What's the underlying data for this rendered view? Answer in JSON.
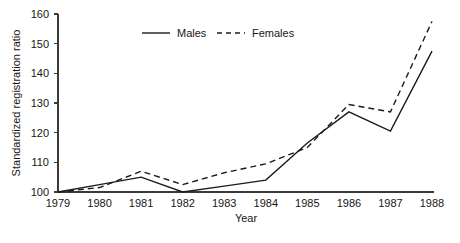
{
  "chart_data": {
    "type": "line",
    "title": "",
    "xlabel": "Year",
    "ylabel": "Standardized registration ratio",
    "x": [
      1979,
      1980,
      1981,
      1982,
      1983,
      1984,
      1985,
      1986,
      1987,
      1988
    ],
    "xtick_labels": [
      "1979",
      "1980",
      "1981",
      "1982",
      "1983",
      "1984",
      "1985",
      "1986",
      "1987",
      "1988"
    ],
    "ytick_labels": [
      "100",
      "110",
      "120",
      "130",
      "140",
      "150",
      "160"
    ],
    "yticks": [
      100,
      110,
      120,
      130,
      140,
      150,
      160
    ],
    "ylim": [
      97,
      161
    ],
    "xlim": [
      1979,
      1988
    ],
    "grid": false,
    "legend_position": "top-center",
    "series": [
      {
        "name": "Males",
        "style": "solid",
        "color": "#1c1c1c",
        "values": [
          100.0,
          102.5,
          105.0,
          100.0,
          102.0,
          104.0,
          116.5,
          127.0,
          120.5,
          147.5
        ]
      },
      {
        "name": "Females",
        "style": "dashed",
        "color": "#1c1c1c",
        "values": [
          100.0,
          101.5,
          107.0,
          102.5,
          106.5,
          109.5,
          115.0,
          129.5,
          127.0,
          157.5
        ]
      }
    ]
  },
  "legend": {
    "entries": [
      {
        "label": "Males",
        "style": "solid"
      },
      {
        "label": "Females",
        "style": "dashed"
      }
    ]
  },
  "axes": {
    "x_title": "Year",
    "y_title": "Standardized registration ratio"
  }
}
